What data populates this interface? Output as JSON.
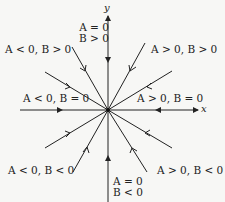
{
  "diagram": {
    "type": "phase-portrait-star-node",
    "axes": {
      "x_label": "x",
      "y_label": "y"
    },
    "origin": {
      "x": 108,
      "y": 110
    },
    "colors": {
      "line": "#222222",
      "background": "#f7f7f5"
    },
    "labels": {
      "top": {
        "line1": "A = 0",
        "line2": "B > 0"
      },
      "upper_left": "A < 0, B > 0",
      "upper_right": "A > 0, B > 0",
      "left": "A < 0, B = 0",
      "right": "A > 0, B = 0",
      "lower_left": "A < 0, B < 0",
      "lower_right": "A > 0, B < 0",
      "bottom": {
        "line1": "A = 0",
        "line2": "B < 0"
      }
    },
    "trajectories": [
      {
        "name": "positive-y",
        "end": [
          108,
          18
        ],
        "arrow": "toward-origin"
      },
      {
        "name": "negative-y",
        "end": [
          108,
          202
        ],
        "arrow": "toward-origin"
      },
      {
        "name": "negative-x",
        "end": [
          20,
          110
        ],
        "arrow": "toward-origin"
      },
      {
        "name": "positive-x",
        "end": [
          196,
          110
        ],
        "arrow": "toward-origin"
      },
      {
        "name": "upper-left-steep",
        "end": [
          72,
          47
        ],
        "arrow": "toward-origin"
      },
      {
        "name": "upper-right-steep",
        "end": [
          145,
          43
        ],
        "arrow": "toward-origin"
      },
      {
        "name": "upper-left-shallow",
        "end": [
          45,
          72
        ],
        "arrow": "toward-origin"
      },
      {
        "name": "upper-right-shallow",
        "end": [
          172,
          71
        ],
        "arrow": "toward-origin"
      },
      {
        "name": "lower-left-shallow",
        "end": [
          45,
          148
        ],
        "arrow": "toward-origin"
      },
      {
        "name": "lower-left-steep",
        "end": [
          73,
          172
        ],
        "arrow": "toward-origin"
      },
      {
        "name": "lower-right-steep",
        "end": [
          147,
          172
        ],
        "arrow": "toward-origin"
      },
      {
        "name": "lower-right-shallow",
        "end": [
          172,
          148
        ],
        "arrow": "toward-origin"
      }
    ]
  }
}
